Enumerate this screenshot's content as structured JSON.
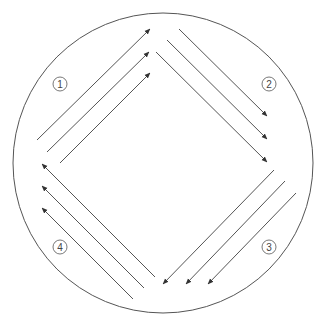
{
  "diagram": {
    "colors": {
      "stroke": "#555555",
      "background": "#ffffff"
    },
    "outer_circle": {
      "cx": 163,
      "cy": 163,
      "r": 150
    },
    "groups": [
      {
        "label": "1",
        "label_pos": [
          60,
          84
        ],
        "direction": "up-right",
        "arrows": [
          {
            "from": [
              37,
              140
            ],
            "to": [
              150,
              29
            ]
          },
          {
            "from": [
              47,
              152
            ],
            "to": [
              149,
              52
            ]
          },
          {
            "from": [
              60,
              163
            ],
            "to": [
              150,
              73
            ]
          }
        ]
      },
      {
        "label": "2",
        "label_pos": [
          269,
          84
        ],
        "direction": "down-right",
        "arrows": [
          {
            "from": [
              179,
              29
            ],
            "to": [
              267,
              116
            ]
          },
          {
            "from": [
              167,
              40
            ],
            "to": [
              267,
              139
            ]
          },
          {
            "from": [
              156,
              52
            ],
            "to": [
              267,
              162
            ]
          }
        ]
      },
      {
        "label": "3",
        "label_pos": [
          269,
          247
        ],
        "direction": "down-left",
        "arrows": [
          {
            "from": [
              274,
              170
            ],
            "to": [
              163,
              284
            ]
          },
          {
            "from": [
              285,
              181
            ],
            "to": [
              186,
              284
            ]
          },
          {
            "from": [
              296,
              193
            ],
            "to": [
              208,
              284
            ]
          }
        ]
      },
      {
        "label": "4",
        "label_pos": [
          60,
          247
        ],
        "direction": "up-left",
        "arrows": [
          {
            "from": [
              155,
              277
            ],
            "to": [
              42,
              164
            ]
          },
          {
            "from": [
              144,
              288
            ],
            "to": [
              42,
              186
            ]
          },
          {
            "from": [
              133,
              299
            ],
            "to": [
              42,
              208
            ]
          }
        ]
      }
    ]
  }
}
